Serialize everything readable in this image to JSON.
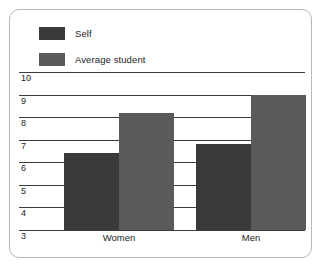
{
  "chart_data": {
    "type": "bar",
    "title": "",
    "xlabel": "",
    "ylabel": "",
    "categories": [
      "Women",
      "Men"
    ],
    "series": [
      {
        "name": "Self",
        "color": "#3a3a3a",
        "values": [
          6.4,
          6.8
        ]
      },
      {
        "name": "Average student",
        "color": "#5a5a5a",
        "values": [
          8.2,
          9.0
        ]
      }
    ],
    "ylim": [
      3,
      10
    ],
    "yticks": [
      10,
      9,
      8,
      7,
      6,
      5,
      4,
      3
    ],
    "grid": true,
    "legend_position": "top-left"
  },
  "legend": {
    "items": [
      {
        "label": "Self",
        "color": "#3a3a3a"
      },
      {
        "label": "Average student",
        "color": "#5a5a5a"
      }
    ]
  },
  "axis": {
    "y_tick_labels": [
      "10",
      "9",
      "8",
      "7",
      "6",
      "5",
      "4",
      "3"
    ],
    "x_tick_labels": [
      "Women",
      "Men"
    ]
  }
}
